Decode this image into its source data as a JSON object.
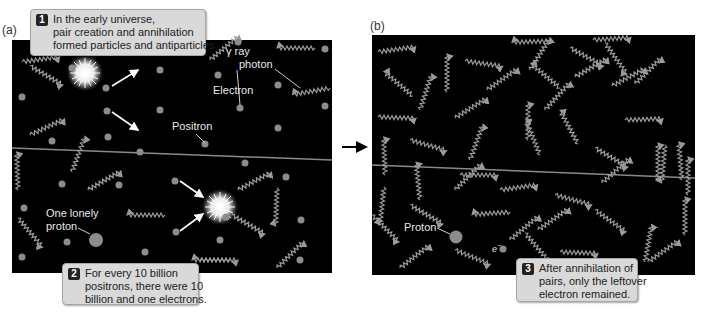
{
  "panels": {
    "a": {
      "label": "(a)",
      "labels": {
        "gamma_line1": "γ ray",
        "gamma_line2": "photon",
        "electron": "Electron",
        "positron": "Positron",
        "proton_line1": "One lonely",
        "proton_line2": "proton"
      }
    },
    "b": {
      "label": "(b)",
      "labels": {
        "proton": "Proton",
        "electron_symbol": "e",
        "electron_superscript": "−"
      }
    }
  },
  "callouts": [
    {
      "number": "1",
      "lines": [
        "In the early universe,",
        "pair creation and annihilation",
        "formed particles and antiparticles."
      ]
    },
    {
      "number": "2",
      "lines": [
        "For every 10 billion",
        "positrons, there were 10",
        "billion and one electrons."
      ]
    },
    {
      "number": "3",
      "lines": [
        "After annihilation of",
        "pairs, only the leftover",
        "electron remained."
      ]
    }
  ],
  "colors": {
    "panel_bg": "#000000",
    "particle": "#8c8c8c",
    "photon": "#9a9a9a",
    "callout_bg": "#d9d9d9",
    "divider_line": "#8a8a8a",
    "burst": "#ffffff"
  }
}
